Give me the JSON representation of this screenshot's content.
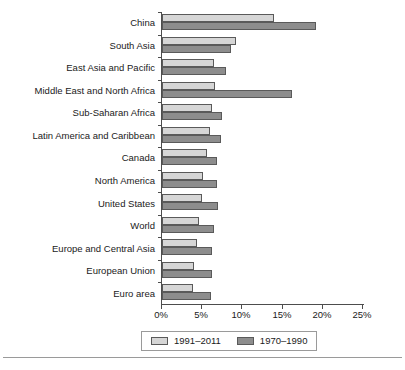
{
  "chart_data": {
    "type": "bar",
    "orientation": "horizontal",
    "title": "",
    "subtitle": "",
    "xlabel": "",
    "ylabel": "",
    "xlim": [
      0,
      25
    ],
    "xunit": "%",
    "grid": false,
    "legend_position": "bottom",
    "categories": [
      "China",
      "South Asia",
      "East Asia and Pacific",
      "Middle East and North Africa",
      "Sub-Saharan Africa",
      "Latin America and Caribbean",
      "Canada",
      "North America",
      "United States",
      "World",
      "Europe and Central Asia",
      "European Union",
      "Euro area"
    ],
    "xticks": [
      0,
      5,
      10,
      15,
      20,
      25
    ],
    "xticklabels": [
      "0%",
      "5%",
      "10%",
      "15%",
      "20%",
      "25%"
    ],
    "series": [
      {
        "name": "1991–2011",
        "color": "#d6d6d6",
        "values": [
          13.9,
          9.2,
          6.5,
          6.6,
          6.2,
          6.0,
          5.6,
          5.1,
          5.0,
          4.6,
          4.4,
          4.0,
          3.9
        ]
      },
      {
        "name": "1970–1990",
        "color": "#8d8d8d",
        "values": [
          19.1,
          8.6,
          8.0,
          16.2,
          7.5,
          7.3,
          6.8,
          6.9,
          7.0,
          6.5,
          6.2,
          6.2,
          6.1
        ]
      }
    ]
  }
}
